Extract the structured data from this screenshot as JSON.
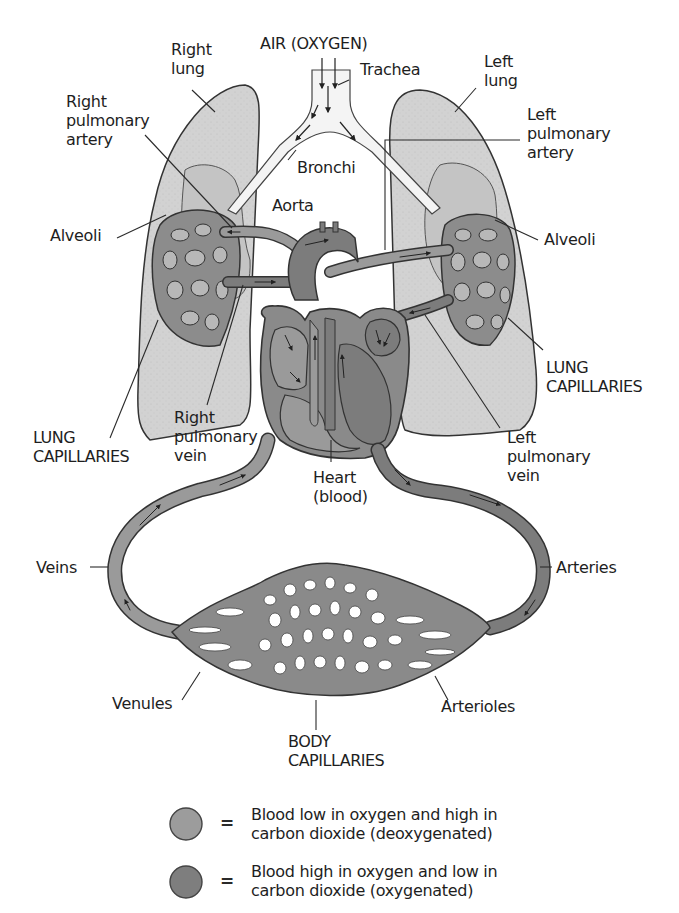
{
  "diagram": {
    "type": "respiratory-circulatory-system",
    "colors": {
      "background": "#ffffff",
      "lung_fill": "#cfcfcf",
      "deoxygenated": "#9a9a9a",
      "oxygenated": "#7c7c7c",
      "outline": "#3a3a3a",
      "airway": "#f2f2f2"
    },
    "labels": {
      "air": "AIR (OXYGEN)",
      "trachea": "Trachea",
      "right_lung": "Right\nlung",
      "left_lung": "Left\nlung",
      "right_pulmonary_artery": "Right\npulmonary\nartery",
      "left_pulmonary_artery": "Left\npulmonary\nartery",
      "bronchi": "Bronchi",
      "aorta": "Aorta",
      "alveoli_left_side": "Alveoli",
      "alveoli_right_side": "Alveoli",
      "lung_capillaries_left_side": "LUNG\nCAPILLARIES",
      "lung_capillaries_right_side": "LUNG\nCAPILLARIES",
      "right_pulmonary_vein": "Right\npulmonary\nvein",
      "left_pulmonary_vein": "Left\npulmonary\nvein",
      "heart": "Heart\n(blood)",
      "veins": "Veins",
      "arteries": "Arteries",
      "venules": "Venules",
      "arterioles": "Arterioles",
      "body_capillaries": "BODY\nCAPILLARIES"
    },
    "legend": [
      {
        "swatch": "deoxygenated",
        "symbol": "=",
        "text": "Blood low in oxygen and high in\ncarbon dioxide (deoxygenated)"
      },
      {
        "swatch": "oxygenated",
        "symbol": "=",
        "text": "Blood high in oxygen and low in\ncarbon dioxide (oxygenated)"
      }
    ]
  }
}
